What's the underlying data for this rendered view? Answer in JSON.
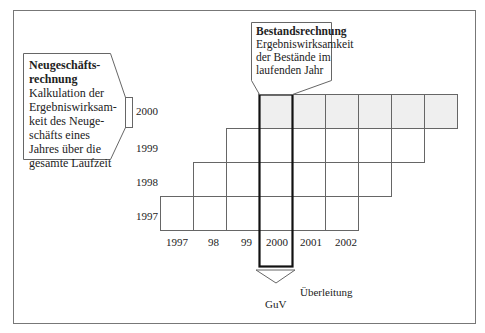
{
  "left_box": {
    "title_line1": "Neugeschäfts-",
    "title_line2": "rechnung",
    "body": [
      "Kalkulation der",
      "Ergebniswirksam-",
      "keit des Neuge-",
      "schäfts eines",
      "Jahres über die",
      "gesamte Laufzeit"
    ]
  },
  "top_box": {
    "title": "Bestandsrechnung",
    "body": [
      "Ergebniswirksamkeit",
      "der Bestände im",
      "laufenden Jahr"
    ]
  },
  "rows": [
    {
      "label": "2000"
    },
    {
      "label": "1999"
    },
    {
      "label": "1998"
    },
    {
      "label": "1997"
    }
  ],
  "columns": [
    "1997",
    "98",
    "99",
    "2000",
    "2001",
    "2002"
  ],
  "bottom": {
    "arrow_label": "Überleitung",
    "target": "GuV"
  },
  "colors": {
    "shaded_row": "#efefef",
    "border": "#555555",
    "highlight": "#111111"
  }
}
